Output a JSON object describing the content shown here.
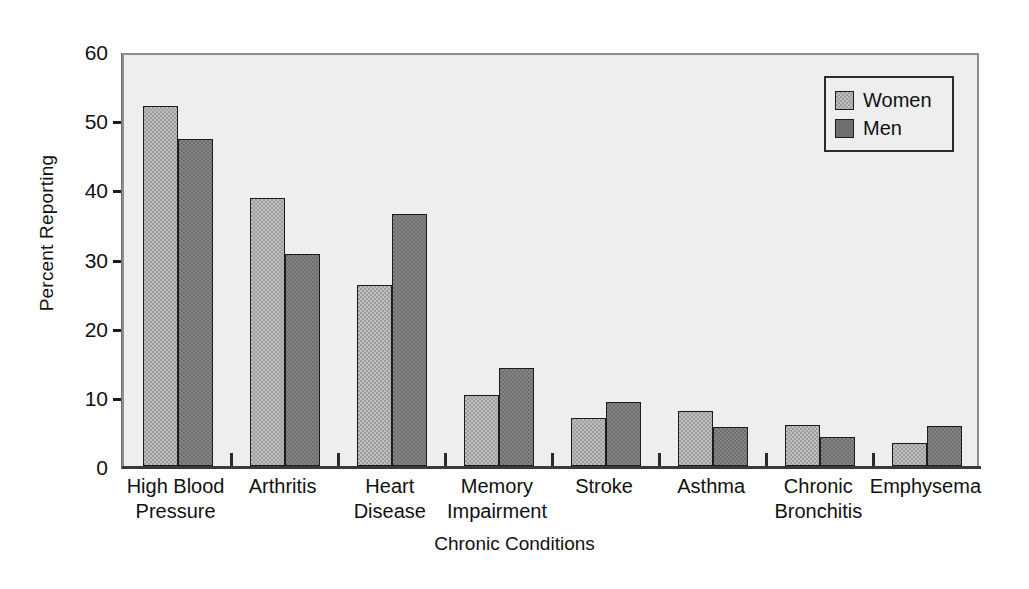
{
  "chart_data": {
    "type": "bar",
    "title": "",
    "xlabel": "Chronic Conditions",
    "ylabel": "Percent Reporting",
    "ylim": [
      0,
      60
    ],
    "ytick_values": [
      0,
      10,
      20,
      30,
      40,
      50,
      60
    ],
    "ytick_labels": [
      "0",
      "10",
      "20",
      "30",
      "40",
      "50",
      "60"
    ],
    "grid": false,
    "legend_position": "top-right",
    "categories": [
      "High Blood\nPressure",
      "Arthritis",
      "Heart\nDisease",
      "Memory\nImpairment",
      "Stroke",
      "Asthma",
      "Chronic\nBronchitis",
      "Emphysema"
    ],
    "series": [
      {
        "name": "Women",
        "color": "#9d9d9d",
        "values": [
          52.0,
          38.8,
          26.2,
          10.3,
          7.0,
          8.0,
          6.0,
          3.3
        ]
      },
      {
        "name": "Men",
        "color": "#6f6f6f",
        "values": [
          47.3,
          30.7,
          36.5,
          14.2,
          9.2,
          5.7,
          4.2,
          5.8
        ]
      }
    ]
  },
  "legend": {
    "entries": [
      {
        "label": "Women",
        "swatch": "women"
      },
      {
        "label": "Men",
        "swatch": "men"
      }
    ]
  }
}
